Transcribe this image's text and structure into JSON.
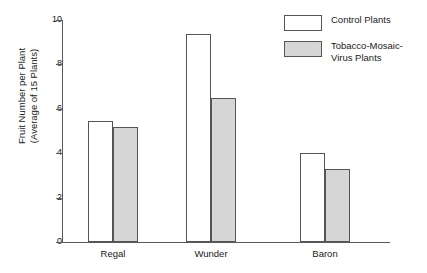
{
  "chart_data": {
    "type": "bar",
    "title": "",
    "xlabel": "",
    "ylabel": "Fruit Number per Plant (Average of 15 Plants)",
    "ylabel_lines": [
      "Fruit Number per Plant",
      "(Average of 15 Plants)"
    ],
    "categories": [
      "Regal",
      "Wunder",
      "Baron"
    ],
    "ylim": [
      0,
      10
    ],
    "yticks": [
      0,
      2,
      4,
      6,
      8,
      10
    ],
    "ytick_labels": [
      "0",
      "2",
      "4",
      "6",
      "8",
      "10"
    ],
    "grid": false,
    "legend_position": "top-right",
    "series": [
      {
        "name": "Control Plants",
        "color": "#ffffff",
        "values": [
          5.45,
          9.35,
          4.0
        ]
      },
      {
        "name": "Tobacco-Mosaic-Virus Plants",
        "color": "#d6d6d6",
        "values": [
          5.2,
          6.5,
          3.3
        ]
      }
    ]
  },
  "legend": {
    "items": [
      {
        "label": "Control Plants",
        "swatch": "white-swatch"
      },
      {
        "label": "Tobacco-Mosaic-Virus Plants",
        "swatch": "gray-swatch"
      }
    ]
  },
  "colors": {
    "control_fill": "#ffffff",
    "treated_fill": "#d6d6d6",
    "bar_border": "#555555",
    "axis": "#5a5a5a",
    "text": "#1a1a1a",
    "background": "#ffffff"
  }
}
